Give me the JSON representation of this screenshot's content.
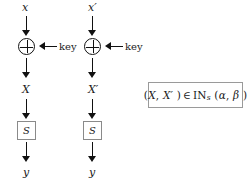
{
  "diagram": {
    "colors": {
      "ink": "#111111",
      "box_border": "#8a8a8a",
      "background": "#ffffff"
    },
    "branches": [
      {
        "id": "left",
        "input_label": "x",
        "xor_icon": "xor-circle",
        "key_label": "key",
        "mid_label": "X",
        "sbox_label": "S",
        "output_label": "y"
      },
      {
        "id": "right",
        "input_label": "x′",
        "xor_icon": "xor-circle",
        "key_label": "key",
        "mid_label": "X′",
        "sbox_label": "S",
        "output_label": "y"
      }
    ],
    "condition_box": {
      "open_paren": "(",
      "first_term": "X",
      "comma": ",",
      "second_term": "X′",
      "close_paren": ")",
      "membership": "∈",
      "set_name": "IN",
      "set_subscript": "s",
      "args_open": "(",
      "alpha": "α",
      "args_comma": ",",
      "beta": "β",
      "args_close": ")",
      "full_text": "(X, X′) ∈ IN_s (α, β)"
    }
  }
}
